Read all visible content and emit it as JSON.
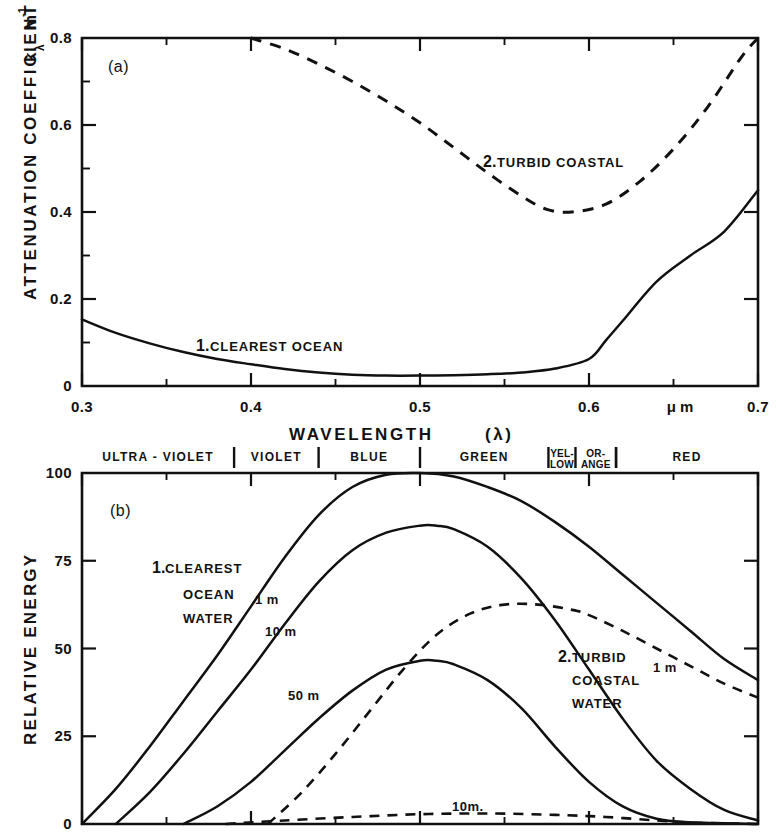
{
  "figure": {
    "panel_a_tag": "(a)",
    "panel_b_tag": "(b)",
    "xaxis_title": "WAVELENGTH",
    "xaxis_symbol": "(λ)",
    "xaxis_unit": "μ m",
    "yaxis_a_title": "ATTENUATION COEFFICIENT",
    "yaxis_a_unit_k": "k",
    "yaxis_a_unit_lambda": "λ",
    "yaxis_a_unit_m": "m",
    "yaxis_a_unit_exp": "-1",
    "yaxis_b_title": "RELATIVE ENERGY",
    "line_color": "#111111",
    "background": "#ffffff"
  },
  "axes": {
    "a": {
      "xlim": [
        0.3,
        0.7
      ],
      "ylim": [
        0,
        0.8
      ],
      "xticks": [
        0.3,
        0.4,
        0.5,
        0.6,
        0.7
      ],
      "xticklabels": [
        "0.3",
        "0.4",
        "0.5",
        "0.6",
        "0.7"
      ],
      "xminorticks": [
        0.35,
        0.45,
        0.55,
        0.65
      ],
      "yticks": [
        0,
        0.2,
        0.4,
        0.6,
        0.8
      ],
      "yticklabels": [
        "0",
        "0.2",
        "0.4",
        "0.6",
        "0.8"
      ],
      "yminorticks": [
        0.1,
        0.3,
        0.5,
        0.7
      ]
    },
    "b": {
      "xlim": [
        0.3,
        0.7
      ],
      "ylim": [
        0,
        100
      ],
      "xticks": [
        0.3,
        0.4,
        0.5,
        0.6,
        0.7
      ],
      "xminorticks": [
        0.35,
        0.45,
        0.55,
        0.65
      ],
      "yticks": [
        0,
        25,
        50,
        75,
        100
      ],
      "yticklabels": [
        "0",
        "25",
        "50",
        "75",
        "100"
      ]
    }
  },
  "spectral_bands": [
    {
      "name": "ULTRA - VIOLET",
      "start": 0.3,
      "end": 0.39
    },
    {
      "name": "VIOLET",
      "start": 0.39,
      "end": 0.44
    },
    {
      "name": "BLUE",
      "start": 0.44,
      "end": 0.5
    },
    {
      "name": "GREEN",
      "start": 0.5,
      "end": 0.576
    },
    {
      "name": "YEL-|LOW",
      "start": 0.576,
      "end": 0.592,
      "small": true
    },
    {
      "name": "OR-|ANGE",
      "start": 0.592,
      "end": 0.616,
      "small": true
    },
    {
      "name": "RED",
      "start": 0.616,
      "end": 0.7
    }
  ],
  "annotations": {
    "a_clearest_num": "1.",
    "a_clearest_text": "CLEAREST   OCEAN",
    "a_turbid_num": "2.",
    "a_turbid_text": "TURBID COASTAL",
    "b_clearest_num": "1.",
    "b_clearest_line1": "CLEAREST",
    "b_clearest_line2": "OCEAN",
    "b_clearest_line3": "WATER",
    "b_turbid_num": "2.",
    "b_turbid_line1": "TURBID",
    "b_turbid_line2": "COASTAL",
    "b_turbid_line3": "WATER",
    "b_depth_1m": "1 m",
    "b_depth_10m": "10 m",
    "b_depth_50m": "50 m",
    "b_turbid_1m": "1 m",
    "b_turbid_10m": "10m."
  },
  "chart_data": [
    {
      "type": "line",
      "panel": "a",
      "title": "Attenuation coefficient vs wavelength",
      "xlabel": "WAVELENGTH (λ)  μ m",
      "ylabel": "ATTENUATION COEFFICIENT kλ m-1",
      "xlim": [
        0.3,
        0.7
      ],
      "ylim": [
        0.0,
        0.8
      ],
      "grid": false,
      "legend": "inline-annotations",
      "series": [
        {
          "name": "1. CLEAREST OCEAN",
          "style": "solid",
          "x": [
            0.3,
            0.32,
            0.34,
            0.36,
            0.38,
            0.4,
            0.42,
            0.44,
            0.46,
            0.48,
            0.5,
            0.52,
            0.54,
            0.56,
            0.58,
            0.6,
            0.61,
            0.62,
            0.64,
            0.66,
            0.68,
            0.7
          ],
          "y": [
            0.153,
            0.122,
            0.098,
            0.078,
            0.062,
            0.05,
            0.039,
            0.031,
            0.026,
            0.024,
            0.024,
            0.025,
            0.027,
            0.031,
            0.04,
            0.062,
            0.105,
            0.15,
            0.24,
            0.3,
            0.355,
            0.45
          ]
        },
        {
          "name": "2. TURBID COASTAL",
          "style": "dashed",
          "x": [
            0.4,
            0.42,
            0.44,
            0.46,
            0.48,
            0.5,
            0.52,
            0.54,
            0.56,
            0.575,
            0.59,
            0.61,
            0.63,
            0.65,
            0.67,
            0.69,
            0.7
          ],
          "y": [
            0.8,
            0.775,
            0.74,
            0.7,
            0.655,
            0.605,
            0.548,
            0.49,
            0.437,
            0.406,
            0.4,
            0.418,
            0.47,
            0.545,
            0.64,
            0.755,
            0.8
          ]
        }
      ]
    },
    {
      "type": "line",
      "panel": "b",
      "title": "Relative energy vs wavelength at depth",
      "xlabel": "WAVELENGTH (λ)",
      "ylabel": "RELATIVE ENERGY",
      "xlim": [
        0.3,
        0.7
      ],
      "ylim": [
        0,
        100
      ],
      "grid": false,
      "legend": "inline-annotations",
      "series": [
        {
          "name": "1. CLEAREST OCEAN WATER — 1 m",
          "style": "solid",
          "x": [
            0.3,
            0.32,
            0.34,
            0.36,
            0.38,
            0.4,
            0.42,
            0.44,
            0.46,
            0.48,
            0.5,
            0.52,
            0.54,
            0.56,
            0.58,
            0.6,
            0.62,
            0.64,
            0.66,
            0.68,
            0.7
          ],
          "y": [
            0.0,
            10.0,
            22.0,
            35.0,
            48.0,
            62.0,
            76.0,
            88.0,
            96.0,
            99.5,
            100.0,
            99.0,
            96.0,
            92.0,
            86.0,
            79.0,
            71.0,
            63.0,
            55.0,
            47.0,
            41.0
          ]
        },
        {
          "name": "1. CLEAREST OCEAN WATER — 10 m",
          "style": "solid",
          "x": [
            0.32,
            0.34,
            0.36,
            0.38,
            0.4,
            0.42,
            0.44,
            0.46,
            0.48,
            0.5,
            0.51,
            0.52,
            0.54,
            0.56,
            0.58,
            0.6,
            0.62,
            0.64,
            0.66,
            0.68,
            0.7
          ],
          "y": [
            0.0,
            9.0,
            20.0,
            32.0,
            44.0,
            57.0,
            69.0,
            78.0,
            83.0,
            85.0,
            85.0,
            84.0,
            79.0,
            70.0,
            58.0,
            44.0,
            30.0,
            18.0,
            10.0,
            4.0,
            1.0
          ]
        },
        {
          "name": "1. CLEAREST OCEAN WATER — 50 m",
          "style": "solid",
          "x": [
            0.36,
            0.38,
            0.4,
            0.42,
            0.44,
            0.46,
            0.48,
            0.5,
            0.51,
            0.52,
            0.54,
            0.56,
            0.58,
            0.6,
            0.62,
            0.64,
            0.66,
            0.7
          ],
          "y": [
            0.0,
            5.0,
            12.0,
            21.0,
            30.0,
            38.0,
            44.0,
            46.5,
            46.5,
            45.5,
            41.0,
            33.0,
            22.0,
            12.0,
            5.0,
            1.5,
            0.5,
            0.0
          ]
        },
        {
          "name": "2. TURBID COASTAL WATER — 1 m",
          "style": "dashed",
          "x": [
            0.41,
            0.43,
            0.45,
            0.47,
            0.49,
            0.51,
            0.53,
            0.55,
            0.57,
            0.59,
            0.6,
            0.62,
            0.64,
            0.66,
            0.68,
            0.7
          ],
          "y": [
            0.0,
            9.0,
            20.0,
            32.0,
            44.0,
            54.0,
            60.0,
            62.5,
            62.5,
            61.0,
            59.5,
            55.0,
            50.0,
            45.0,
            40.0,
            36.0
          ]
        },
        {
          "name": "2. TURBID COASTAL WATER — 10 m",
          "style": "dashed",
          "x": [
            0.385,
            0.42,
            0.46,
            0.5,
            0.54,
            0.58,
            0.61,
            0.64,
            0.66,
            0.7
          ],
          "y": [
            0.0,
            1.0,
            2.0,
            2.8,
            3.0,
            2.6,
            2.0,
            1.0,
            0.4,
            0.0
          ]
        }
      ]
    }
  ]
}
